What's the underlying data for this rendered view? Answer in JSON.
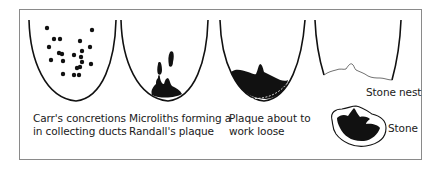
{
  "figure": {
    "panels": [
      {
        "id": "carrs-concretions",
        "line1": "Carr's concretions",
        "line2": "in collecting ducts"
      },
      {
        "id": "microliths",
        "line1": "Microliths forming a",
        "line2": "Randall's plaque"
      },
      {
        "id": "plaque-loose",
        "line1": "Plaque about to",
        "line2": "work loose"
      },
      {
        "id": "stone-nest",
        "line1": "Stone nest"
      },
      {
        "id": "stone",
        "line1": "Stone"
      }
    ],
    "colors": {
      "ink": "#111111",
      "frame": "#8a8a8a",
      "background": "#ffffff"
    }
  }
}
